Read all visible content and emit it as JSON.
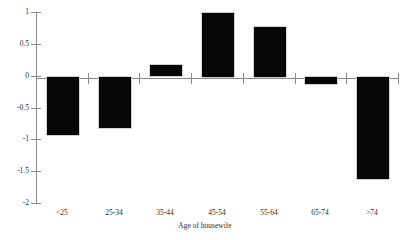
{
  "chart_data": {
    "type": "bar",
    "title": "",
    "subtitle": "",
    "xlabel": "Age of housewife",
    "ylabel": "",
    "categories": [
      "<25",
      "25-34",
      "35-44",
      "45-54",
      "55-64",
      "65-74",
      ">74"
    ],
    "values": [
      -0.91,
      -0.8,
      0.18,
      1.0,
      0.78,
      -0.11,
      -1.6
    ],
    "ylim": [
      -2,
      1
    ],
    "yticks": [
      1,
      0.5,
      0,
      -0.5,
      -1,
      -1.5,
      -2
    ],
    "ytick_labels": [
      "1",
      "0.5",
      "0",
      "-0.5",
      "-1",
      "-1.5",
      "-2"
    ],
    "grid": false,
    "legend": false,
    "legend_position": "none",
    "bar_color": "#060606",
    "axis_color": "#8a8a8a",
    "zero_line": 0
  }
}
